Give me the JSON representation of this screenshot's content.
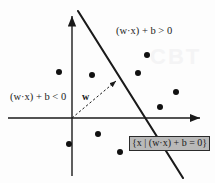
{
  "figure": {
    "background_color": "#fdfdfd",
    "ink_color": "#1a1a1a",
    "box_fill_color": "#b9b9b9"
  },
  "labels": {
    "positive_region": "(w·x) + b > 0",
    "negative_region": "(w·x) + b < 0",
    "weight_vector": "w",
    "hyperplane_set": "{x | (w·x) + b = 0}"
  },
  "watermark": {
    "text_1": "CBT",
    "text_2": ""
  },
  "chart_data": {
    "type": "scatter",
    "xlabel": "",
    "ylabel": "",
    "grid": false,
    "legend": "none",
    "axes": {
      "origin_px": [
        72,
        118
      ],
      "x_axis_px": {
        "x1": 8,
        "y1": 118,
        "x2": 205,
        "y2": 118,
        "arrow": "right"
      },
      "y_axis_px": {
        "x1": 72,
        "y1": 176,
        "x2": 72,
        "y2": 11,
        "arrow": "up"
      }
    },
    "hyperplane": {
      "label": "{x | (w·x) + b = 0}",
      "px": {
        "x1": 78,
        "y1": 11,
        "x2": 183,
        "y2": 178
      },
      "style": "solid",
      "width_px": 2
    },
    "weight_vector": {
      "label": "w",
      "px": {
        "x1": 72,
        "y1": 118,
        "x2": 119,
        "y2": 79
      },
      "style": "dashed",
      "arrow": "end"
    },
    "points": [
      {
        "px": [
          59,
          72
        ],
        "class": "negative"
      },
      {
        "px": [
          92,
          75
        ],
        "class": "negative"
      },
      {
        "px": [
          69,
          144
        ],
        "class": "negative"
      },
      {
        "px": [
          98,
          134
        ],
        "class": "negative"
      },
      {
        "px": [
          120,
          152
        ],
        "class": "negative"
      },
      {
        "px": [
          147,
          55
        ],
        "class": "positive"
      },
      {
        "px": [
          138,
          73
        ],
        "class": "positive"
      },
      {
        "px": [
          176,
          92
        ],
        "class": "positive"
      },
      {
        "px": [
          160,
          107
        ],
        "class": "positive"
      }
    ],
    "point_marker": {
      "shape": "circle",
      "radius_px": 3,
      "color": "#111111"
    }
  }
}
